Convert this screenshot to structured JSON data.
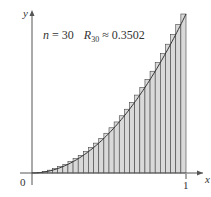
{
  "chart_data": {
    "type": "bar",
    "title": "",
    "annotation": {
      "n_label": "n = 30",
      "r_label": "R",
      "r_sub": "30",
      "r_value": "≈ 0.3502"
    },
    "xlabel": "x",
    "ylabel": "y",
    "x_ticks": [
      "0",
      "1"
    ],
    "function": "y = x^2",
    "n": 30,
    "method": "right endpoint",
    "xlim": [
      0,
      1
    ],
    "ylim": [
      0,
      1
    ],
    "values": [
      0.0011,
      0.0044,
      0.01,
      0.0178,
      0.0278,
      0.04,
      0.0544,
      0.0711,
      0.09,
      0.1111,
      0.1344,
      0.16,
      0.1878,
      0.2178,
      0.25,
      0.2844,
      0.3211,
      0.36,
      0.4011,
      0.4444,
      0.49,
      0.5378,
      0.5878,
      0.64,
      0.6944,
      0.7511,
      0.81,
      0.8711,
      0.9344,
      1.0
    ],
    "colors": {
      "bar_fill": "#d9d9d9",
      "bar_edge": "#444444",
      "curve": "#333333",
      "axis": "#555555"
    }
  }
}
